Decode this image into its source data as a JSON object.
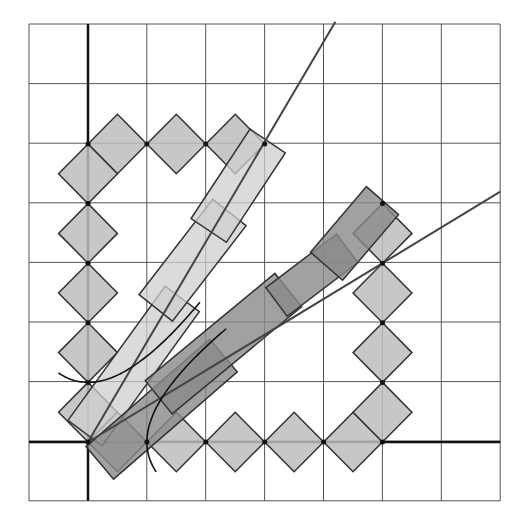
{
  "diagram": {
    "type": "lattice-geometry",
    "grid": {
      "cols": 8,
      "rows": 8,
      "x0": 29,
      "y0": 24,
      "cell_w": 58.9,
      "cell_h": 59.6,
      "line_color": "#555555"
    },
    "origin_px": [
      88,
      442
    ],
    "unit_px": [
      58.9,
      59.6
    ],
    "colors": {
      "diamond_fill": "#bdbdbd",
      "light_bar": "#cfcfcf",
      "dark_bar": "#8a8a8a",
      "stroke": "#333333",
      "axis": "#111111"
    },
    "diamonds_upper": [
      [
        0.5,
        5
      ],
      [
        1.5,
        5
      ],
      [
        2.5,
        5
      ],
      [
        0,
        4.5
      ],
      [
        0,
        3.5
      ],
      [
        0,
        2.5
      ],
      [
        0,
        1.5
      ],
      [
        0,
        0.5
      ]
    ],
    "diamonds_lower": [
      [
        0.5,
        0
      ],
      [
        1.5,
        0
      ],
      [
        2.5,
        0
      ],
      [
        3.5,
        0
      ],
      [
        4.5,
        0
      ],
      [
        5,
        0.5
      ],
      [
        5,
        1.5
      ],
      [
        5,
        2.5
      ],
      [
        5,
        3.5
      ]
    ],
    "line_upper": {
      "from": [
        0,
        0
      ],
      "to": [
        4.2,
        7
      ]
    },
    "line_lower": {
      "from": [
        0,
        0
      ],
      "to": [
        7,
        4.2
      ]
    }
  }
}
